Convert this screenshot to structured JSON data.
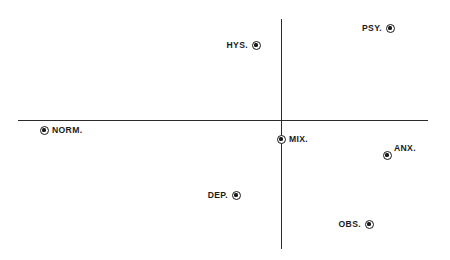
{
  "figure": {
    "background_color": "#ffffff",
    "axis_color": "#2b2b2b",
    "marker_color": "#1a1a1a",
    "width": 450,
    "height": 260
  },
  "chart_data": {
    "type": "scatter",
    "title": "",
    "subtitle": "",
    "xlabel": "",
    "ylabel": "",
    "grid": false,
    "legend": "none",
    "axes": {
      "style": "crossed-axes-through-origin",
      "origin_px": {
        "x": 281,
        "y": 120
      },
      "x_axis_px": {
        "x_start": 18,
        "x_end": 428,
        "y": 120
      },
      "y_axis_px": {
        "y_start": 19,
        "y_end": 249,
        "x": 281
      },
      "x_tick_labels": [],
      "y_tick_labels": []
    },
    "point_labels": [
      "PSY.",
      "HYS.",
      "NORM.",
      "MIX.",
      "ANX.",
      "DEP.",
      "OBS."
    ],
    "points": [
      {
        "label": "PSY.",
        "px": 390,
        "py": 28,
        "label_side": "left"
      },
      {
        "label": "HYS.",
        "px": 256,
        "py": 45,
        "label_side": "left"
      },
      {
        "label": "NORM.",
        "px": 44,
        "py": 130,
        "label_side": "right"
      },
      {
        "label": "MIX.",
        "px": 281,
        "py": 139,
        "label_side": "right"
      },
      {
        "label": "ANX.",
        "px": 387,
        "py": 155,
        "label_side": "right-up"
      },
      {
        "label": "DEP.",
        "px": 236,
        "py": 195,
        "label_side": "left"
      },
      {
        "label": "OBS.",
        "px": 369,
        "py": 224,
        "label_side": "left"
      }
    ],
    "x": [
      0.53,
      0.06,
      -1.16,
      0.0,
      0.52,
      -0.22,
      0.43
    ],
    "y": [
      0.8,
      0.65,
      -0.04,
      -0.08,
      -0.15,
      -0.33,
      -0.45
    ]
  }
}
